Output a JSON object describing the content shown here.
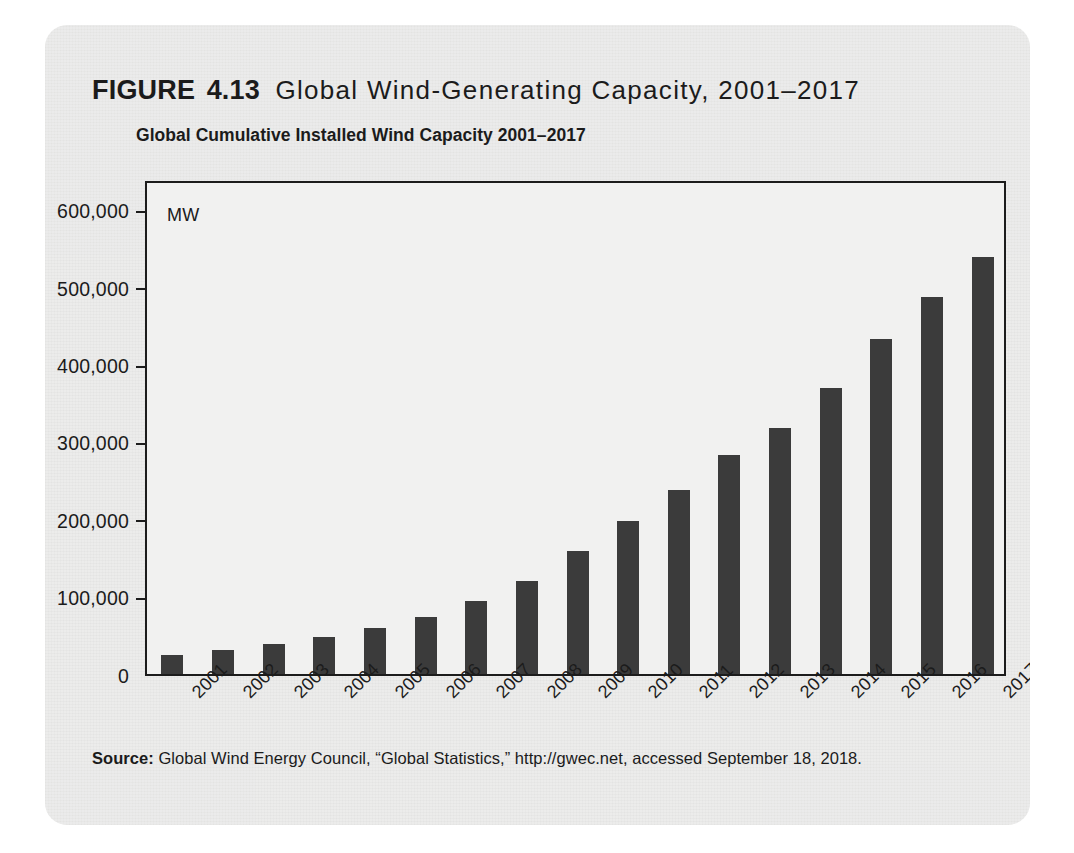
{
  "figure": {
    "label": "FIGURE",
    "number": "4.13",
    "title": "Global Wind-Generating Capacity, 2001–2017"
  },
  "source_note": {
    "prefix": "Source:",
    "text": "Global Wind Energy Council, “Global Statistics,” http://gwec.net, accessed September 18, 2018."
  },
  "colors": {
    "bar": "#3b3b3b",
    "axis": "#1c1c1c",
    "plot_background": "#f1f1f0",
    "card_background": "#ececeb",
    "text": "#1b1b1b"
  },
  "chart_data": {
    "type": "bar",
    "title": "Global Cumulative Installed Wind Capacity 2001–2017",
    "xlabel": "",
    "ylabel": "MW",
    "unit_label": "MW",
    "ylim": [
      0,
      640000
    ],
    "grid": false,
    "legend": false,
    "categories": [
      "2001",
      "2002",
      "2003",
      "2004",
      "2005",
      "2006",
      "2007",
      "2008",
      "2009",
      "2010",
      "2011",
      "2012",
      "2013",
      "2014",
      "2015",
      "2016",
      "2017"
    ],
    "values": [
      24322,
      31181,
      39295,
      47693,
      59091,
      74122,
      93927,
      120716,
      159054,
      197956,
      238110,
      282850,
      318697,
      369862,
      432680,
      487657,
      539581
    ],
    "ytick_labels": [
      "0",
      "100,000",
      "200,000",
      "300,000",
      "400,000",
      "500,000",
      "600,000"
    ],
    "ytick_values": [
      0,
      100000,
      200000,
      300000,
      400000,
      500000,
      600000
    ]
  }
}
